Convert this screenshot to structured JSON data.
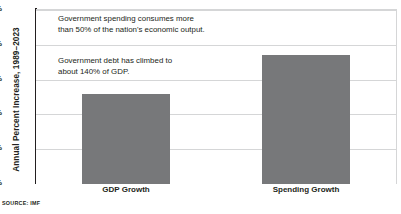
{
  "chart_data": {
    "type": "bar",
    "title": "",
    "subtitle": "",
    "xlabel": "",
    "ylabel": "Annual Percent Increase, 1989–2023",
    "categories": [
      "GDP Growth",
      "Spending Growth"
    ],
    "values": [
      2.6,
      3.7
    ],
    "series": [
      {
        "name": "Annual Percent Increase, 1989–2023",
        "values": [
          2.6,
          3.7
        ]
      }
    ],
    "ylim": [
      0,
      5
    ],
    "ytick_values": [
      0,
      1,
      2,
      3,
      4,
      5
    ],
    "ytick_labels": [
      "0%",
      "1%",
      "2%",
      "3%",
      "4%",
      "5%"
    ],
    "grid": "horizontal",
    "legend": "none",
    "bar_color": "#77787a",
    "annotations": [
      "Government spending consumes more\nthan 50% of the nation's economic output.",
      "Government debt has climbed to\nabout 140% of GDP."
    ],
    "source": "SOURCE: IMF"
  },
  "colors": {
    "bar": "#77787a",
    "axis": "#231f20",
    "grid": "#d5d6d7",
    "background": "#ffffff",
    "text": "#231f20"
  }
}
